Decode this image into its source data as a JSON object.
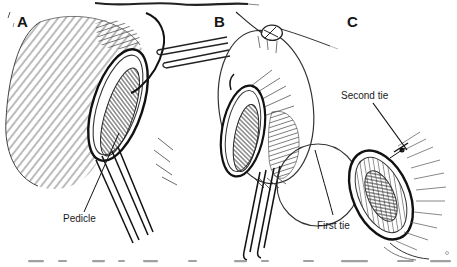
{
  "figure": {
    "type": "surgical-line-illustration",
    "panels": [
      {
        "letter": "A",
        "part_label": "Pedicle"
      },
      {
        "letter": "B",
        "part_label": "First tie"
      },
      {
        "letter": "C",
        "part_label": "Second tie"
      }
    ],
    "colors": {
      "ink": "#1a1a1a",
      "paper": "#ffffff",
      "caption_gray": "#a0a0a0"
    }
  }
}
